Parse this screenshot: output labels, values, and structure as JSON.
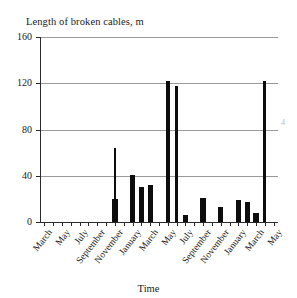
{
  "chart_data": {
    "type": "bar",
    "title": "Length of broken cables, m",
    "xlabel": "Time",
    "ylabel": "",
    "ylim": [
      0,
      160
    ],
    "yticks": [
      0,
      40,
      80,
      120,
      160
    ],
    "ytick_labels": [
      "0",
      "40",
      "80",
      "120",
      "160"
    ],
    "grid": true,
    "legend": "none",
    "xtick_labels": [
      "March",
      "May",
      "July",
      "September",
      "November",
      "January",
      "March",
      "May",
      "July",
      "September",
      "November",
      "January",
      "March",
      "May"
    ],
    "categories": [
      "March",
      "April",
      "May",
      "June",
      "July",
      "August",
      "September",
      "October",
      "November",
      "December",
      "January",
      "February",
      "March",
      "April",
      "May",
      "June",
      "July",
      "August",
      "September",
      "October",
      "November",
      "December",
      "January",
      "February",
      "March",
      "April",
      "May"
    ],
    "values": [
      0,
      0,
      0,
      0,
      0,
      0,
      0,
      0,
      64,
      0,
      41,
      30,
      32,
      0,
      122,
      118,
      6,
      0,
      21,
      0,
      13,
      0,
      19,
      17,
      8,
      122,
      0
    ],
    "value_notes": [
      {
        "label": "November",
        "value": 64,
        "note": "tall thin bar with wider base ~20"
      },
      {
        "label": "March (year 2)",
        "value": 122,
        "note": "tallest in pair"
      },
      {
        "label": "April (year 2)",
        "value": 118,
        "note": "second of pair"
      },
      {
        "label": "April (year 3)",
        "value": 122,
        "note": "far right tall bar"
      }
    ]
  },
  "chart": {
    "title": "Length of broken cables, m",
    "axis_caption": "Time"
  },
  "specks": {
    "mark": "4"
  }
}
